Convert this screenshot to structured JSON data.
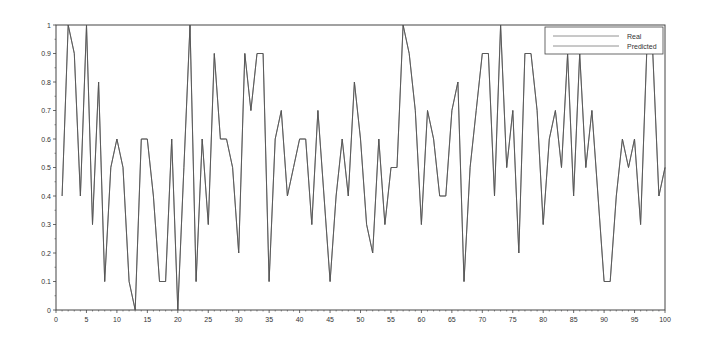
{
  "chart_data": {
    "type": "line",
    "title": "",
    "xlabel": "",
    "ylabel": "",
    "xlim": [
      0,
      100
    ],
    "ylim": [
      0,
      1
    ],
    "grid": false,
    "legend_position": "top-right",
    "x_ticks": [
      0,
      5,
      10,
      15,
      20,
      25,
      30,
      35,
      40,
      45,
      50,
      55,
      60,
      65,
      70,
      75,
      80,
      85,
      90,
      95,
      100
    ],
    "y_ticks": [
      0,
      0.1,
      0.2,
      0.3,
      0.4,
      0.5,
      0.6,
      0.7,
      0.8,
      0.9,
      1
    ],
    "y_tick_labels": [
      "0",
      "0.1",
      "0.2",
      "0.3",
      "0.4",
      "0.5",
      "0.6",
      "0.7",
      "0.8",
      "0.9",
      "1"
    ],
    "x": [
      1,
      2,
      3,
      4,
      5,
      6,
      7,
      8,
      9,
      10,
      11,
      12,
      13,
      14,
      15,
      16,
      17,
      18,
      19,
      20,
      21,
      22,
      23,
      24,
      25,
      26,
      27,
      28,
      29,
      30,
      31,
      32,
      33,
      34,
      35,
      36,
      37,
      38,
      39,
      40,
      41,
      42,
      43,
      44,
      45,
      46,
      47,
      48,
      49,
      50,
      51,
      52,
      53,
      54,
      55,
      56,
      57,
      58,
      59,
      60,
      61,
      62,
      63,
      64,
      65,
      66,
      67,
      68,
      69,
      70,
      71,
      72,
      73,
      74,
      75,
      76,
      77,
      78,
      79,
      80,
      81,
      82,
      83,
      84,
      85,
      86,
      87,
      88,
      89,
      90,
      91,
      92,
      93,
      94,
      95,
      96,
      97,
      98,
      99,
      100
    ],
    "series": [
      {
        "name": "Real",
        "color": "#555555",
        "values": [
          0.4,
          1.0,
          0.9,
          0.4,
          1.0,
          0.3,
          0.8,
          0.1,
          0.5,
          0.6,
          0.5,
          0.1,
          0.0,
          0.6,
          0.6,
          0.4,
          0.1,
          0.1,
          0.6,
          0.0,
          0.5,
          1.0,
          0.1,
          0.6,
          0.3,
          0.9,
          0.6,
          0.6,
          0.5,
          0.2,
          0.9,
          0.7,
          0.9,
          0.9,
          0.1,
          0.6,
          0.7,
          0.4,
          0.5,
          0.6,
          0.6,
          0.3,
          0.7,
          0.4,
          0.1,
          0.4,
          0.6,
          0.4,
          0.8,
          0.6,
          0.3,
          0.2,
          0.6,
          0.3,
          0.5,
          0.5,
          1.0,
          0.9,
          0.7,
          0.3,
          0.7,
          0.6,
          0.4,
          0.4,
          0.7,
          0.8,
          0.1,
          0.5,
          0.7,
          0.9,
          0.9,
          0.4,
          1.0,
          0.5,
          0.7,
          0.2,
          0.9,
          0.9,
          0.7,
          0.3,
          0.6,
          0.7,
          0.5,
          0.9,
          0.4,
          0.9,
          0.5,
          0.7,
          0.4,
          0.1,
          0.1,
          0.4,
          0.6,
          0.5,
          0.6,
          0.3,
          0.9,
          0.9,
          0.4,
          0.5
        ]
      },
      {
        "name": "Predicted",
        "color": "#555555",
        "values": [
          0.4,
          1.0,
          0.9,
          0.4,
          1.0,
          0.3,
          0.8,
          0.1,
          0.5,
          0.6,
          0.5,
          0.1,
          0.0,
          0.6,
          0.6,
          0.4,
          0.1,
          0.1,
          0.6,
          0.0,
          0.5,
          1.0,
          0.1,
          0.6,
          0.3,
          0.9,
          0.6,
          0.6,
          0.5,
          0.2,
          0.9,
          0.7,
          0.9,
          0.9,
          0.1,
          0.6,
          0.7,
          0.4,
          0.5,
          0.6,
          0.6,
          0.3,
          0.7,
          0.4,
          0.1,
          0.4,
          0.6,
          0.4,
          0.8,
          0.6,
          0.3,
          0.2,
          0.6,
          0.3,
          0.5,
          0.5,
          1.0,
          0.9,
          0.7,
          0.3,
          0.7,
          0.6,
          0.4,
          0.4,
          0.7,
          0.8,
          0.1,
          0.5,
          0.7,
          0.9,
          0.9,
          0.4,
          1.0,
          0.5,
          0.7,
          0.2,
          0.9,
          0.9,
          0.7,
          0.3,
          0.6,
          0.7,
          0.5,
          0.9,
          0.4,
          0.9,
          0.5,
          0.7,
          0.4,
          0.1,
          0.1,
          0.4,
          0.6,
          0.5,
          0.6,
          0.3,
          0.9,
          0.9,
          0.4,
          0.5
        ]
      }
    ],
    "legend": [
      "Real",
      "Predicted"
    ]
  },
  "layout": {
    "plot_left": 56,
    "plot_right": 665,
    "plot_top": 25,
    "plot_bottom": 310,
    "axis_color": "#444444",
    "legend_box": {
      "x": 545,
      "y": 27,
      "width": 118,
      "height": 27
    }
  }
}
